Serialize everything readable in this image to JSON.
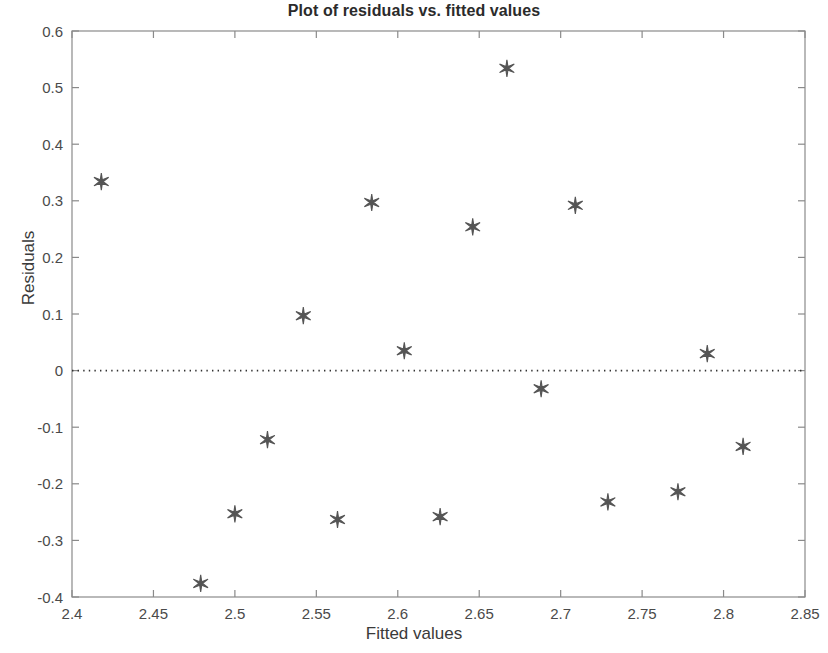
{
  "chart_data": {
    "type": "scatter",
    "title": "Plot of residuals vs. fitted values",
    "xlabel": "Fitted values",
    "ylabel": "Residuals",
    "xlim": [
      2.4,
      2.85
    ],
    "ylim": [
      -0.4,
      0.6
    ],
    "xticks": [
      2.4,
      2.45,
      2.5,
      2.55,
      2.6,
      2.65,
      2.7,
      2.75,
      2.8,
      2.85
    ],
    "xtick_labels": [
      "2.4",
      "2.45",
      "2.5",
      "2.55",
      "2.6",
      "2.65",
      "2.7",
      "2.75",
      "2.8",
      "2.85"
    ],
    "yticks": [
      -0.4,
      -0.3,
      -0.2,
      -0.1,
      0,
      0.1,
      0.2,
      0.3,
      0.4,
      0.5,
      0.6
    ],
    "ytick_labels": [
      "-0.4",
      "-0.3",
      "-0.2",
      "-0.1",
      "0",
      "0.1",
      "0.2",
      "0.3",
      "0.4",
      "0.5",
      "0.6"
    ],
    "grid": false,
    "legend": null,
    "marker": "six-pointed-star",
    "marker_color": "#555555",
    "reference_line": {
      "orientation": "horizontal",
      "y": 0,
      "style": "dotted",
      "color": "#333333"
    },
    "axis_color": "#8a8a8a",
    "x": [
      2.418,
      2.479,
      2.5,
      2.52,
      2.542,
      2.563,
      2.584,
      2.604,
      2.626,
      2.646,
      2.667,
      2.688,
      2.709,
      2.729,
      2.772,
      2.79,
      2.812
    ],
    "y": [
      0.334,
      -0.376,
      -0.253,
      -0.122,
      0.097,
      -0.263,
      0.297,
      0.035,
      -0.258,
      0.254,
      0.534,
      -0.032,
      0.292,
      -0.232,
      -0.214,
      0.03,
      -0.134
    ],
    "points": [
      {
        "x": 2.418,
        "y": 0.334
      },
      {
        "x": 2.479,
        "y": -0.376
      },
      {
        "x": 2.5,
        "y": -0.253
      },
      {
        "x": 2.52,
        "y": -0.122
      },
      {
        "x": 2.542,
        "y": 0.097
      },
      {
        "x": 2.563,
        "y": -0.263
      },
      {
        "x": 2.584,
        "y": 0.297
      },
      {
        "x": 2.604,
        "y": 0.035
      },
      {
        "x": 2.626,
        "y": -0.258
      },
      {
        "x": 2.646,
        "y": 0.254
      },
      {
        "x": 2.667,
        "y": 0.534
      },
      {
        "x": 2.688,
        "y": -0.032
      },
      {
        "x": 2.709,
        "y": 0.292
      },
      {
        "x": 2.729,
        "y": -0.232
      },
      {
        "x": 2.772,
        "y": -0.214
      },
      {
        "x": 2.79,
        "y": 0.03
      },
      {
        "x": 2.812,
        "y": -0.134
      }
    ]
  },
  "layout": {
    "plot_left": 72,
    "plot_right": 805,
    "plot_top": 31,
    "plot_bottom": 597
  }
}
